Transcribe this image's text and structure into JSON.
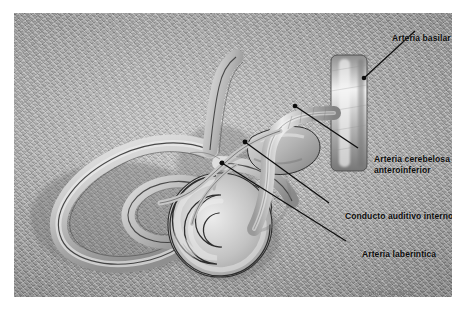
{
  "figure": {
    "title_alt": "Irrigacion arterial del oido interno",
    "background_color": "#a0a0a0",
    "line_color": "#111111",
    "label_color": "#0c0c0c",
    "watermark": "©marie rossettie"
  },
  "labels": [
    {
      "id": "arteria-basilar",
      "text": "Arteria basilar",
      "lines": [
        "Arteria basilar"
      ],
      "leader": {
        "from": [
          415,
          31
        ],
        "to": [
          364,
          78
        ]
      },
      "anchor_dot": [
        364,
        78
      ]
    },
    {
      "id": "arteria-cerebelosa-anteroinferior",
      "text": "Arteria cerebelosa anteroinferior",
      "lines": [
        "Arteria cerebelosa",
        "anteroinferior"
      ],
      "leader": {
        "from": [
          358,
          148
        ],
        "to": [
          295,
          106
        ]
      },
      "anchor_dot": [
        295,
        106
      ]
    },
    {
      "id": "conducto-auditivo-interno",
      "text": "Conducto auditivo interno",
      "lines": [
        "Conducto auditivo interno"
      ],
      "leader": {
        "from": [
          329,
          203
        ],
        "to": [
          245,
          142
        ]
      },
      "anchor_dot": [
        245,
        142
      ]
    },
    {
      "id": "arteria-laberintica",
      "text": "Arteria laberintica",
      "lines": [
        "Arteria laberintica"
      ],
      "leader": {
        "from": [
          346,
          241
        ],
        "to": [
          222,
          163
        ]
      },
      "anchor_dot": [
        222,
        163
      ]
    }
  ],
  "structures": [
    {
      "name": "semicircular-canals",
      "label_visible": false
    },
    {
      "name": "vestibule",
      "label_visible": false
    },
    {
      "name": "cochlea",
      "label_visible": false
    },
    {
      "name": "internal-auditory-canal",
      "label_visible": true
    },
    {
      "name": "basilar-artery-trunk",
      "label_visible": true
    },
    {
      "name": "aica-branch",
      "label_visible": true
    },
    {
      "name": "labyrinthine-artery",
      "label_visible": true
    }
  ]
}
